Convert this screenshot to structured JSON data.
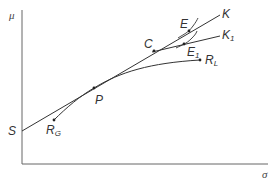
{
  "diagram": {
    "title": "",
    "axes": {
      "y_label": "μ",
      "x_label": "σ"
    },
    "points": {
      "S": {
        "label": "S",
        "sub": ""
      },
      "P": {
        "label": "P",
        "sub": ""
      },
      "C": {
        "label": "C",
        "sub": ""
      },
      "E": {
        "label": "E",
        "sub": ""
      },
      "E1": {
        "label": "E",
        "sub": "1"
      },
      "RL": {
        "label": "R",
        "sub": "L"
      },
      "RG": {
        "label": "R",
        "sub": "G"
      }
    },
    "lines": {
      "K": {
        "label": "K",
        "sub": ""
      },
      "K1": {
        "label": "K",
        "sub": "1"
      }
    },
    "colors": {
      "line": "#333333",
      "axis": "#555555"
    }
  }
}
